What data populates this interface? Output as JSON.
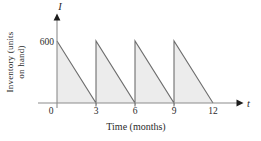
{
  "figure": {
    "background": "#ffffff"
  },
  "chart_data": {
    "type": "area",
    "title": "",
    "xlabel": "Time (months)",
    "ylabel": "Inventory (units on hand)",
    "ylabel_lines": [
      "Inventory (units",
      "on hand)"
    ],
    "x_axis_symbol": "t",
    "y_axis_symbol": "I",
    "xlim": [
      0,
      12
    ],
    "ylim": [
      0,
      600
    ],
    "x_ticks": [
      0,
      3,
      6,
      9,
      12
    ],
    "x_tick_marks": [
      3,
      6,
      9
    ],
    "y_ticks": [
      600
    ],
    "grid": false,
    "legend": false,
    "series": [
      {
        "name": "inventory-level",
        "shape": "sawtooth",
        "points": [
          [
            0,
            600
          ],
          [
            3,
            0
          ],
          [
            3,
            600
          ],
          [
            6,
            0
          ],
          [
            6,
            600
          ],
          [
            9,
            0
          ],
          [
            9,
            600
          ],
          [
            12,
            0
          ]
        ]
      }
    ],
    "colors": {
      "area_fill": "#ececec",
      "series_line": "#6e6e6e",
      "axis_line": "#8c8c8c",
      "arrowhead": "#1c1c1c",
      "text": "#2b2b2b"
    }
  }
}
